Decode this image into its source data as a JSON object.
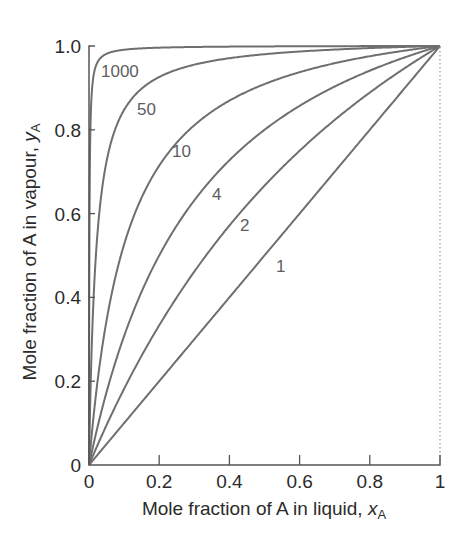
{
  "chart_data": {
    "type": "line",
    "title": "",
    "xlabel": "Mole fraction of A in liquid, x_A",
    "ylabel": "Mole fraction of A in vapour, y_A",
    "xlabel_text": "Mole fraction of A in liquid, ",
    "xlabel_var": "x",
    "xlabel_sub": "A",
    "ylabel_text": "Mole fraction of A in vapour, ",
    "ylabel_var": "y",
    "ylabel_sub": "A",
    "xlim": [
      0,
      1
    ],
    "ylim": [
      0,
      1
    ],
    "x_ticks": [
      {
        "value": 0,
        "label": "0"
      },
      {
        "value": 0.2,
        "label": "0.2"
      },
      {
        "value": 0.4,
        "label": "0.4"
      },
      {
        "value": 0.6,
        "label": "0.6"
      },
      {
        "value": 0.8,
        "label": "0.8"
      },
      {
        "value": 1,
        "label": "1"
      }
    ],
    "y_ticks": [
      {
        "value": 0,
        "label": "0"
      },
      {
        "value": 0.2,
        "label": "0.2"
      },
      {
        "value": 0.4,
        "label": "0.4"
      },
      {
        "value": 0.6,
        "label": "0.6"
      },
      {
        "value": 0.8,
        "label": "0.8"
      },
      {
        "value": 1.0,
        "label": "1.0"
      }
    ],
    "grid": false,
    "legend": "inline curve labels",
    "curve_formula": "y = a*x / (1 + (a-1)*x)",
    "x": [
      0,
      0.1,
      0.2,
      0.3,
      0.4,
      0.5,
      0.6,
      0.7,
      0.8,
      0.9,
      1.0
    ],
    "series": [
      {
        "name": "1",
        "param": 1,
        "label_pos": [
          276,
          272
        ],
        "values": [
          0,
          0.1,
          0.2,
          0.3,
          0.4,
          0.5,
          0.6,
          0.7,
          0.8,
          0.9,
          1.0
        ]
      },
      {
        "name": "2",
        "param": 2,
        "label_pos": [
          240,
          231
        ],
        "values": [
          0,
          0.182,
          0.333,
          0.462,
          0.571,
          0.667,
          0.75,
          0.824,
          0.889,
          0.947,
          1.0
        ]
      },
      {
        "name": "4",
        "param": 4,
        "label_pos": [
          212,
          200
        ],
        "values": [
          0,
          0.308,
          0.5,
          0.632,
          0.727,
          0.8,
          0.857,
          0.903,
          0.941,
          0.973,
          1.0
        ]
      },
      {
        "name": "10",
        "param": 10,
        "label_pos": [
          172,
          157
        ],
        "values": [
          0,
          0.526,
          0.714,
          0.811,
          0.87,
          0.909,
          0.938,
          0.959,
          0.976,
          0.989,
          1.0
        ]
      },
      {
        "name": "50",
        "param": 50,
        "label_pos": [
          137,
          115
        ],
        "values": [
          0,
          0.847,
          0.926,
          0.955,
          0.971,
          0.98,
          0.987,
          0.991,
          0.995,
          0.998,
          1.0
        ]
      },
      {
        "name": "1000",
        "param": 1000,
        "label_pos": [
          101,
          77
        ],
        "values": [
          0,
          0.991,
          0.996,
          0.998,
          0.998,
          0.999,
          0.999,
          1.0,
          1.0,
          1.0,
          1.0
        ]
      }
    ],
    "colors": {
      "curve": "#6f6f6f",
      "axis": "#555555",
      "text": "#2b2b2b",
      "curve_label": "#5e5e5e",
      "dotted_edge": "#9a9a9a"
    }
  }
}
